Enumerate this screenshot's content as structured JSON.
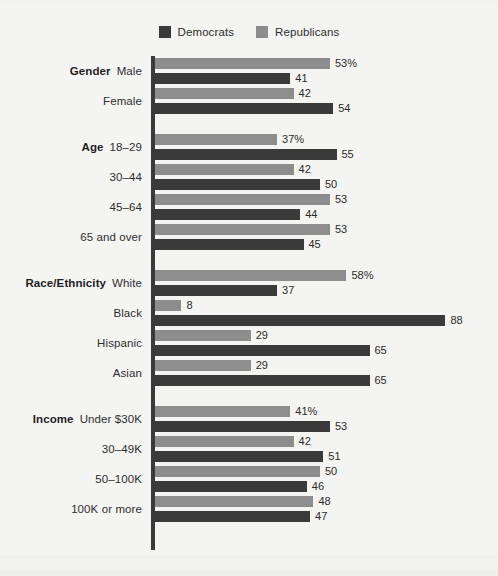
{
  "legend": {
    "items": [
      {
        "label": "Democrats",
        "color": "#3a3a3a",
        "icon": "legend-swatch-democrats"
      },
      {
        "label": "Republicans",
        "color": "#8d8d8d",
        "icon": "legend-swatch-republicans"
      }
    ]
  },
  "axis": {
    "max": 88,
    "pixels_per_unit": 3.3
  },
  "colors": {
    "democrat": "#3a3a3a",
    "republican": "#8d8d8d",
    "background": "#f4f4f2",
    "axis": "#3a3a3a",
    "text": "#2e2e2e"
  },
  "chart_data": {
    "type": "bar",
    "orientation": "horizontal",
    "title": "",
    "subtitle": "",
    "xlabel": "",
    "ylabel": "",
    "xlim": [
      0,
      88
    ],
    "grid": false,
    "legend_position": "top-center",
    "series": [
      {
        "name": "Republicans",
        "color": "#8d8d8d",
        "values": [
          53,
          42,
          37,
          42,
          53,
          53,
          58,
          8,
          29,
          29,
          41,
          42,
          50,
          48
        ]
      },
      {
        "name": "Democrats",
        "color": "#3a3a3a",
        "values": [
          41,
          54,
          55,
          50,
          44,
          45,
          37,
          88,
          65,
          65,
          53,
          51,
          46,
          47
        ]
      }
    ],
    "categories": [
      "Male",
      "Female",
      "18–29",
      "30–44",
      "45–64",
      "65 and over",
      "White",
      "Black",
      "Hispanic",
      "Asian",
      "Under $30K",
      "30–49K",
      "50–100K",
      "100K or more"
    ],
    "groups": [
      {
        "name": "Gender",
        "rows": [
          {
            "category": "Gender",
            "label": "Male",
            "republican": "53%",
            "republican_value": 53,
            "democrat": "41",
            "democrat_value": 41
          },
          {
            "category": "",
            "label": "Female",
            "republican": "42",
            "republican_value": 42,
            "democrat": "54",
            "democrat_value": 54
          }
        ]
      },
      {
        "name": "Age",
        "rows": [
          {
            "category": "Age",
            "label": "18–29",
            "republican": "37%",
            "republican_value": 37,
            "democrat": "55",
            "democrat_value": 55
          },
          {
            "category": "",
            "label": "30–44",
            "republican": "42",
            "republican_value": 42,
            "democrat": "50",
            "democrat_value": 50
          },
          {
            "category": "",
            "label": "45–64",
            "republican": "53",
            "republican_value": 53,
            "democrat": "44",
            "democrat_value": 44
          },
          {
            "category": "",
            "label": "65 and over",
            "republican": "53",
            "republican_value": 53,
            "democrat": "45",
            "democrat_value": 45
          }
        ]
      },
      {
        "name": "Race/Ethnicity",
        "rows": [
          {
            "category": "Race/Ethnicity",
            "label": "White",
            "republican": "58%",
            "republican_value": 58,
            "democrat": "37",
            "democrat_value": 37
          },
          {
            "category": "",
            "label": "Black",
            "republican": "8",
            "republican_value": 8,
            "democrat": "88",
            "democrat_value": 88
          },
          {
            "category": "",
            "label": "Hispanic",
            "republican": "29",
            "republican_value": 29,
            "democrat": "65",
            "democrat_value": 65
          },
          {
            "category": "",
            "label": "Asian",
            "republican": "29",
            "republican_value": 29,
            "democrat": "65",
            "democrat_value": 65
          }
        ]
      },
      {
        "name": "Income",
        "rows": [
          {
            "category": "Income",
            "label": "Under $30K",
            "republican": "41%",
            "republican_value": 41,
            "democrat": "53",
            "democrat_value": 53
          },
          {
            "category": "",
            "label": "30–49K",
            "republican": "42",
            "republican_value": 42,
            "democrat": "51",
            "democrat_value": 51
          },
          {
            "category": "",
            "label": "50–100K",
            "republican": "50",
            "republican_value": 50,
            "democrat": "46",
            "democrat_value": 46
          },
          {
            "category": "",
            "label": "100K or more",
            "republican": "48",
            "republican_value": 48,
            "democrat": "47",
            "democrat_value": 47
          }
        ]
      }
    ]
  }
}
